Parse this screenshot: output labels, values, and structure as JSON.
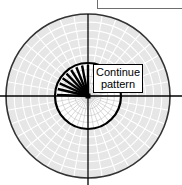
{
  "figure": {
    "name": "polar-grid-diagram",
    "background_color": "#ffffff"
  },
  "colors": {
    "annulus_fill": "#e6e6e6",
    "inner_fill": "#ffffff",
    "outer_grid_line": "#ffffff",
    "inner_grid_line": "#c9c9c9",
    "outer_circle_stroke": "#333333",
    "inner_circle_stroke": "#000000",
    "axis_stroke": "#000000",
    "ray_stroke": "#000000",
    "center_marker": "#000000",
    "callout_border": "#000000",
    "callout_background": "#ffffff",
    "text": "#000000",
    "top_box_border": "#6e6e6e"
  },
  "geometry": {
    "center_x": 88,
    "center_y": 96,
    "outer_radius": 82,
    "inner_radius": 33,
    "ring_count_outer": 6,
    "sector_count": 36,
    "ring_count_inner": 4
  },
  "axes": {
    "horizontal": {
      "x1": 0,
      "y1": 96,
      "x2": 182,
      "y2": 96
    },
    "vertical": {
      "x1": 88,
      "y1": 14,
      "x2": 88,
      "y2": 185
    }
  },
  "rays": {
    "count": 9,
    "angles_deg": [
      90,
      101,
      112,
      123,
      134,
      145,
      156,
      167,
      178
    ],
    "length": 31,
    "stroke_width": 2.4
  },
  "center_marker": {
    "shape": "square",
    "size": 5
  },
  "callout": {
    "line1": "Continue",
    "line2": "pattern"
  },
  "top_right_box": {
    "label": ""
  }
}
